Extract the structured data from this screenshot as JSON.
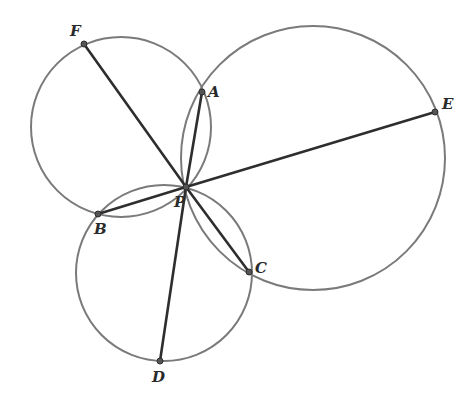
{
  "figure": {
    "type": "geometry",
    "colors": {
      "circle": "#7a7a7a",
      "segment": "#2e2e2e",
      "background": "#ffffff"
    },
    "points": [
      {
        "name": "F",
        "x": 84,
        "y": 44,
        "label_x": 70,
        "label_y": 24
      },
      {
        "name": "A",
        "x": 202,
        "y": 92,
        "label_x": 208,
        "label_y": 85
      },
      {
        "name": "E",
        "x": 435,
        "y": 112,
        "label_x": 442,
        "label_y": 97
      },
      {
        "name": "P",
        "x": 186,
        "y": 187,
        "label_x": 174,
        "label_y": 195
      },
      {
        "name": "B",
        "x": 98,
        "y": 214,
        "label_x": 94,
        "label_y": 222
      },
      {
        "name": "C",
        "x": 249,
        "y": 272,
        "label_x": 255,
        "label_y": 261
      },
      {
        "name": "D",
        "x": 160,
        "y": 361,
        "label_x": 152,
        "label_y": 370
      }
    ],
    "circles": [
      {
        "name": "circle-PF",
        "cx": 121,
        "cy": 127,
        "r": 90
      },
      {
        "name": "circle-PE",
        "cx": 313,
        "cy": 158,
        "r": 132
      },
      {
        "name": "circle-PD",
        "cx": 164,
        "cy": 273,
        "r": 88
      }
    ],
    "segments": [
      [
        "P",
        "F"
      ],
      [
        "P",
        "A"
      ],
      [
        "P",
        "E"
      ],
      [
        "P",
        "B"
      ],
      [
        "P",
        "C"
      ],
      [
        "P",
        "D"
      ]
    ]
  },
  "labels": {
    "F": "F",
    "A": "A",
    "E": "E",
    "P": "P",
    "B": "B",
    "C": "C",
    "D": "D"
  }
}
